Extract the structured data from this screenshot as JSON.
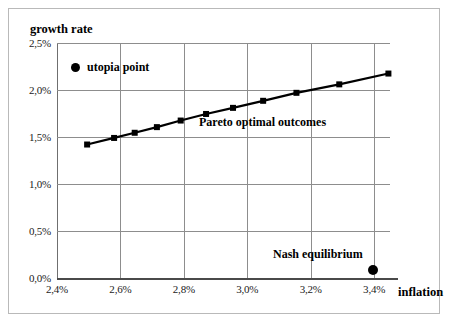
{
  "chart_data": {
    "type": "line",
    "title": "",
    "xlabel": "inflation",
    "ylabel": "growth rate",
    "xlim": [
      2.4,
      3.45
    ],
    "ylim": [
      0.0,
      2.5
    ],
    "grid": true,
    "xticks": [
      "2,4%",
      "2,6%",
      "2,8%",
      "3,0%",
      "3,2%",
      "3,4%"
    ],
    "xtick_values": [
      2.4,
      2.6,
      2.8,
      3.0,
      3.2,
      3.4
    ],
    "yticks": [
      "0,0%",
      "0,5%",
      "1,0%",
      "1,5%",
      "2,0%",
      "2,5%"
    ],
    "ytick_values": [
      0.0,
      0.5,
      1.0,
      1.5,
      2.0,
      2.5
    ],
    "series": [
      {
        "name": "Pareto optimal outcomes",
        "marker": "square",
        "color": "#000000",
        "x": [
          2.495,
          2.58,
          2.645,
          2.715,
          2.79,
          2.87,
          2.955,
          3.05,
          3.155,
          3.29,
          3.445
        ],
        "y": [
          1.42,
          1.49,
          1.545,
          1.605,
          1.675,
          1.745,
          1.81,
          1.885,
          1.97,
          2.06,
          2.175
        ]
      },
      {
        "name": "Nash equilibrium",
        "marker": "circle",
        "color": "#000000",
        "x": [
          3.395
        ],
        "y": [
          0.08
        ]
      }
    ],
    "annotations": [
      {
        "text": "Pareto optimal outcomes",
        "x": 2.9,
        "y": 1.55
      },
      {
        "text": "Nash equilibrium",
        "x": 3.13,
        "y": 0.32
      }
    ],
    "legend": {
      "position": "inside-top-left",
      "entries": [
        {
          "label": "utopia point",
          "marker": "circle",
          "color": "#000000"
        }
      ]
    }
  },
  "axes": {
    "y_title": "growth rate",
    "x_title": "inflation"
  },
  "labels": {
    "legend_utopia": "utopia point",
    "pareto": "Pareto optimal outcomes",
    "nash": "Nash equilibrium"
  },
  "colors": {
    "line": "#000000",
    "marker": "#000000",
    "grid": "#8d8d8d",
    "axis": "#4a4a4a",
    "background": "#ffffff",
    "border": "#b9b9b9"
  }
}
